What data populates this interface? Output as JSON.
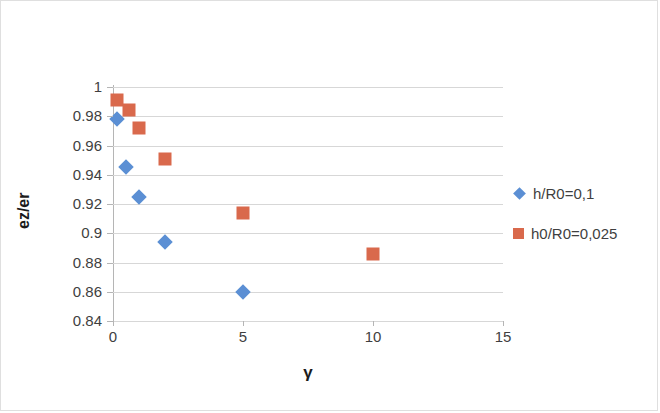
{
  "chart_data": {
    "type": "scatter",
    "title": "",
    "xlabel": "γ",
    "ylabel": "ez/er",
    "xlim": [
      0,
      15
    ],
    "ylim": [
      0.84,
      1
    ],
    "xticks": [
      "0",
      "5",
      "10",
      "15"
    ],
    "xtick_values": [
      0,
      5,
      10,
      15
    ],
    "yticks": [
      "1",
      "0.98",
      "0.96",
      "0.94",
      "0.92",
      "0.9",
      "0.88",
      "0.86",
      "0.84"
    ],
    "ytick_values": [
      1,
      0.98,
      0.96,
      0.94,
      0.92,
      0.9,
      0.88,
      0.86,
      0.84
    ],
    "grid": "horizontal",
    "legend_position": "right",
    "series": [
      {
        "name": "h/R0=0,1",
        "marker": "diamond",
        "color": "#5B8FD4",
        "points": [
          {
            "x": 0.15,
            "y": 0.978
          },
          {
            "x": 0.5,
            "y": 0.945
          },
          {
            "x": 1.0,
            "y": 0.925
          },
          {
            "x": 2.0,
            "y": 0.894
          },
          {
            "x": 5.0,
            "y": 0.86
          }
        ]
      },
      {
        "name": "h0/R0=0,025",
        "marker": "square",
        "color": "#D9694C",
        "points": [
          {
            "x": 0.15,
            "y": 0.991
          },
          {
            "x": 0.6,
            "y": 0.984
          },
          {
            "x": 1.0,
            "y": 0.972
          },
          {
            "x": 2.0,
            "y": 0.951
          },
          {
            "x": 5.0,
            "y": 0.914
          },
          {
            "x": 10.0,
            "y": 0.886
          }
        ]
      }
    ]
  },
  "colors": {
    "series_blue": "#5B8FD4",
    "series_orange": "#D9694C",
    "gridline": "#d7d7d7",
    "axis": "#b5b5b5",
    "text": "#3f3f3f",
    "title_text": "#1b1b1b",
    "frame": "#dfdfdf",
    "background": "#ffffff"
  }
}
